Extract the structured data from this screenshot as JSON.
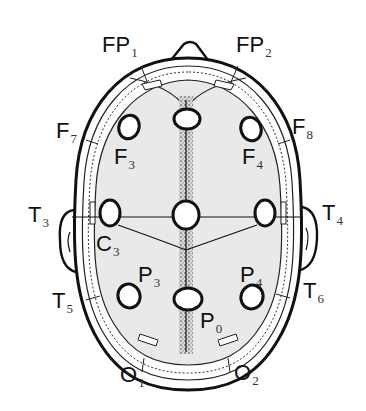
{
  "diagram": {
    "title": "",
    "colors": {
      "outline": "#111111",
      "brain_fill": "#e9e9e9",
      "electrode_fill": "#ffffff",
      "midline_stipple": "#555555"
    },
    "electrodes": [
      {
        "id": "FP1",
        "base": "FP",
        "sub": "1"
      },
      {
        "id": "FP2",
        "base": "FP",
        "sub": "2"
      },
      {
        "id": "F7",
        "base": "F",
        "sub": "7"
      },
      {
        "id": "F8",
        "base": "F",
        "sub": "8"
      },
      {
        "id": "F3",
        "base": "F",
        "sub": "3"
      },
      {
        "id": "F4",
        "base": "F",
        "sub": "4"
      },
      {
        "id": "T3",
        "base": "T",
        "sub": "3"
      },
      {
        "id": "T4",
        "base": "T",
        "sub": "4"
      },
      {
        "id": "C3",
        "base": "C",
        "sub": "3"
      },
      {
        "id": "P3",
        "base": "P",
        "sub": "3"
      },
      {
        "id": "P4",
        "base": "P",
        "sub": "4"
      },
      {
        "id": "T5",
        "base": "T",
        "sub": "5"
      },
      {
        "id": "T6",
        "base": "T",
        "sub": "6"
      },
      {
        "id": "P0",
        "base": "P",
        "sub": "0"
      },
      {
        "id": "O1",
        "base": "O",
        "sub": "1"
      },
      {
        "id": "O2",
        "base": "O",
        "sub": "2"
      }
    ]
  }
}
